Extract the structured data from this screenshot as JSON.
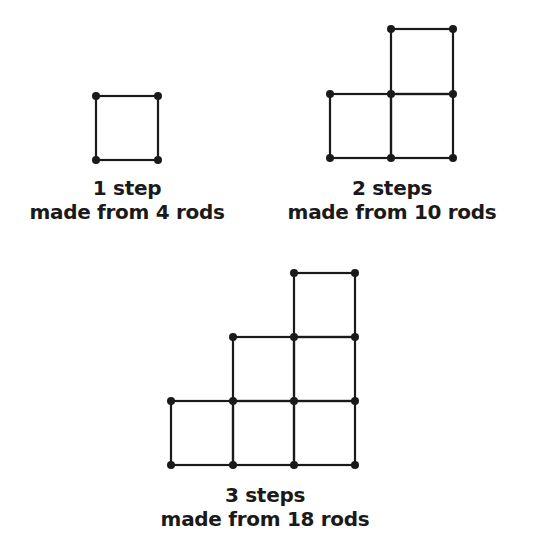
{
  "figures": [
    {
      "id": "step1",
      "caption_line1": "1 step",
      "caption_line2": "made from 4 rods",
      "steps": 1,
      "rods": 4
    },
    {
      "id": "step2",
      "caption_line1": "2 steps",
      "caption_line2": "made from 10 rods",
      "steps": 2,
      "rods": 10
    },
    {
      "id": "step3",
      "caption_line1": "3 steps",
      "caption_line2": "made from 18 rods",
      "steps": 3,
      "rods": 18
    }
  ],
  "colors": {
    "line": "#1a1a1a",
    "background": "#ffffff"
  }
}
